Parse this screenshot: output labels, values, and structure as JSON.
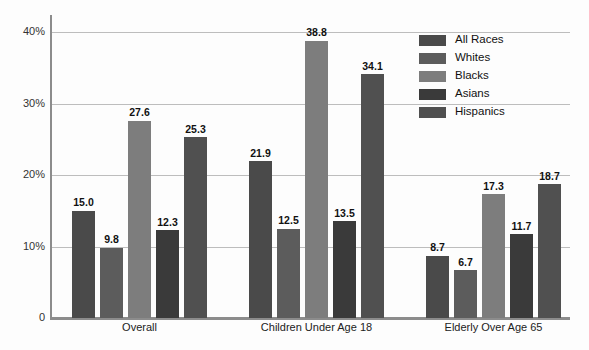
{
  "chart_data": {
    "type": "bar",
    "title": "",
    "xlabel": "",
    "ylabel": "",
    "ylim": [
      0,
      40
    ],
    "grid": true,
    "legend_position": "top-right",
    "categories": [
      "Overall",
      "Children Under Age 18",
      "Elderly Over Age 65"
    ],
    "ytick_labels": [
      "0",
      "10%",
      "20%",
      "30%",
      "40%"
    ],
    "ytick_values": [
      0,
      10,
      20,
      30,
      40
    ],
    "series": [
      {
        "name": "All Races",
        "color": "#4a4a4a",
        "values": [
          15.0,
          21.9,
          8.7
        ],
        "labels": [
          "15.0",
          "21.9",
          "8.7"
        ]
      },
      {
        "name": "Whites",
        "color": "#5c5c5c",
        "values": [
          9.8,
          12.5,
          6.7
        ],
        "labels": [
          "9.8",
          "12.5",
          "6.7"
        ]
      },
      {
        "name": "Blacks",
        "color": "#7d7d7d",
        "values": [
          27.6,
          38.8,
          17.3
        ],
        "labels": [
          "27.6",
          "38.8",
          "17.3"
        ]
      },
      {
        "name": "Asians",
        "color": "#3a3a3a",
        "values": [
          12.3,
          13.5,
          11.7
        ],
        "labels": [
          "12.3",
          "13.5",
          "11.7"
        ]
      },
      {
        "name": "Hispanics",
        "color": "#505050",
        "values": [
          25.3,
          34.1,
          18.7
        ],
        "labels": [
          "25.3",
          "34.1",
          "18.7"
        ]
      }
    ]
  },
  "legend": {
    "items": [
      {
        "label": "All Races",
        "color": "#4a4a4a"
      },
      {
        "label": "Whites",
        "color": "#5c5c5c"
      },
      {
        "label": "Blacks",
        "color": "#7d7d7d"
      },
      {
        "label": "Asians",
        "color": "#3a3a3a"
      },
      {
        "label": "Hispanics",
        "color": "#505050"
      }
    ]
  }
}
